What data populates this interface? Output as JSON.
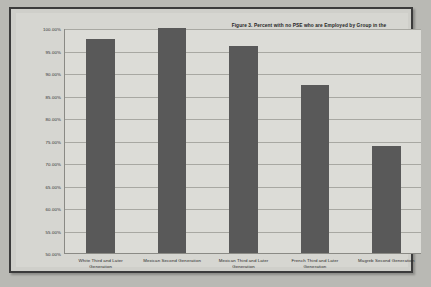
{
  "chart_data": {
    "type": "bar",
    "title": "Figure 3. Percent  with no PSE who are Employed  by Group in the United States and France (2000/2001)",
    "title_line1": "Figure 3. Percent  with no PSE who are Employed  by Group in the",
    "title_line2": "United States and France (2000/2001)",
    "xlabel": "",
    "ylabel": "",
    "ylim": [
      50,
      100
    ],
    "ytick_step": 5,
    "grid": true,
    "legend": "none",
    "categories": [
      "White Third and Later Generation",
      "Mexican Second Generation",
      "Mexican Third and Later Generation",
      "French Third and Later Generation",
      "Magreb Second Generation"
    ],
    "category_lines": [
      [
        "White Third and Later",
        "Generation"
      ],
      [
        "Mexican Second Generation",
        ""
      ],
      [
        "Mexican Third and Later",
        "Generation"
      ],
      [
        "French Third and Later",
        "Generation"
      ],
      [
        "Magreb Second Generation",
        ""
      ]
    ],
    "values": [
      97.5,
      100.0,
      96.0,
      87.3,
      73.7
    ],
    "ytick_labels": [
      "100.00%",
      "95.00%",
      "90.00%",
      "85.00%",
      "80.00%",
      "75.00%",
      "70.00%",
      "65.00%",
      "60.00%",
      "55.00%",
      "50.00%"
    ],
    "ytick_values": [
      100,
      95,
      90,
      85,
      80,
      75,
      70,
      65,
      60,
      55,
      50
    ],
    "colors": {
      "bar": "#595959",
      "plot_background": "#dcdcd7",
      "page_background": "#cfcfca",
      "gridline": "#a8a8a2",
      "axis": "#8a8a85",
      "frame_border": "#3b3b3b",
      "text": "#2b2b2b"
    }
  }
}
